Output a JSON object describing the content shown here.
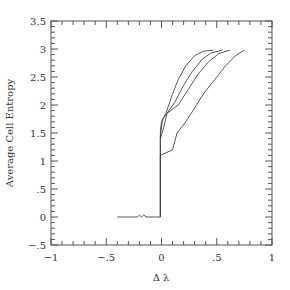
{
  "chart_data": {
    "type": "line",
    "title": "",
    "xlabel": "Δ λ",
    "ylabel": "Average Cell Entropy",
    "xlim": [
      -1,
      1
    ],
    "ylim": [
      -0.5,
      3.5
    ],
    "grid": false,
    "legend": null,
    "x_ticks": [
      {
        "value": -1,
        "label": "−1"
      },
      {
        "value": -0.5,
        "label": "−.5"
      },
      {
        "value": 0,
        "label": "0"
      },
      {
        "value": 0.5,
        "label": ".5"
      },
      {
        "value": 1,
        "label": "1"
      }
    ],
    "y_ticks": [
      {
        "value": -0.5,
        "label": "−.5"
      },
      {
        "value": 0,
        "label": "0"
      },
      {
        "value": 0.5,
        "label": ".5"
      },
      {
        "value": 1,
        "label": "1"
      },
      {
        "value": 1.5,
        "label": "1.5"
      },
      {
        "value": 2,
        "label": "2"
      },
      {
        "value": 2.5,
        "label": "2.5"
      },
      {
        "value": 3,
        "label": "3"
      },
      {
        "value": 3.5,
        "label": "3.5"
      }
    ],
    "series": [
      {
        "name": "curve-1",
        "points": [
          [
            -0.4,
            0
          ],
          [
            -0.22,
            0
          ],
          [
            -0.2,
            0.03
          ],
          [
            -0.18,
            0
          ],
          [
            -0.16,
            0.04
          ],
          [
            -0.14,
            0
          ],
          [
            -0.01,
            0
          ],
          [
            -0.01,
            1.55
          ],
          [
            0.0,
            1.7
          ],
          [
            0.04,
            1.85
          ],
          [
            0.1,
            2.2
          ],
          [
            0.15,
            2.45
          ],
          [
            0.22,
            2.7
          ],
          [
            0.3,
            2.88
          ],
          [
            0.38,
            2.96
          ],
          [
            0.47,
            2.98
          ]
        ]
      },
      {
        "name": "curve-2",
        "points": [
          [
            -0.01,
            0
          ],
          [
            -0.01,
            1.4
          ],
          [
            0.02,
            1.6
          ],
          [
            0.05,
            1.85
          ],
          [
            0.12,
            2.05
          ],
          [
            0.2,
            2.35
          ],
          [
            0.28,
            2.6
          ],
          [
            0.37,
            2.82
          ],
          [
            0.45,
            2.93
          ],
          [
            0.55,
            2.98
          ]
        ]
      },
      {
        "name": "curve-3",
        "points": [
          [
            -0.01,
            0
          ],
          [
            -0.01,
            1.45
          ],
          [
            0.01,
            1.75
          ],
          [
            0.05,
            1.85
          ],
          [
            0.15,
            2.0
          ],
          [
            0.25,
            2.3
          ],
          [
            0.33,
            2.55
          ],
          [
            0.43,
            2.78
          ],
          [
            0.52,
            2.92
          ],
          [
            0.62,
            2.98
          ]
        ]
      },
      {
        "name": "curve-4",
        "points": [
          [
            -0.01,
            0
          ],
          [
            -0.01,
            1.1
          ],
          [
            0.1,
            1.2
          ],
          [
            0.14,
            1.5
          ],
          [
            0.22,
            1.7
          ],
          [
            0.3,
            1.95
          ],
          [
            0.38,
            2.2
          ],
          [
            0.48,
            2.45
          ],
          [
            0.58,
            2.7
          ],
          [
            0.67,
            2.88
          ],
          [
            0.75,
            2.98
          ]
        ]
      }
    ]
  }
}
